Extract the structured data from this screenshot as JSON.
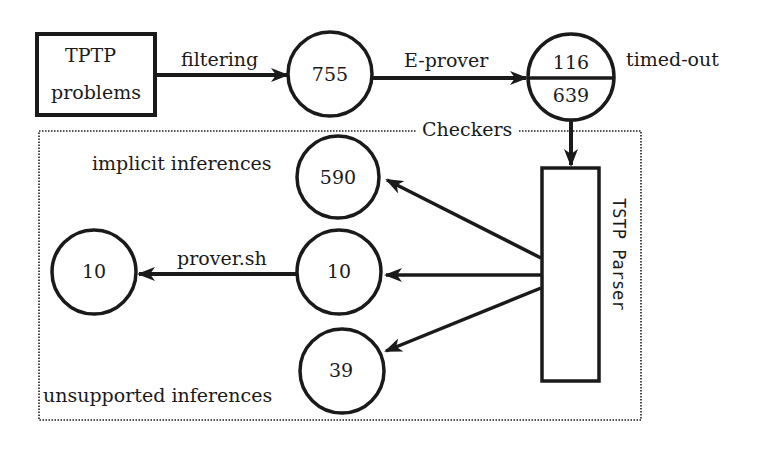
{
  "diagram": {
    "type": "flow",
    "nodes": {
      "source": {
        "line1": "TPTP",
        "line2": "problems"
      },
      "filtered": {
        "value": "755"
      },
      "split": {
        "top": "116",
        "bottom": "639",
        "note": "timed-out"
      },
      "parser": {
        "label": "TSTP Parser"
      },
      "implicit": {
        "value": "590",
        "label": "implicit inferences"
      },
      "middle": {
        "value": "10"
      },
      "prover_result": {
        "value": "10"
      },
      "unsupported": {
        "value": "39",
        "label": "unsupported inferences"
      }
    },
    "edges": {
      "filtering": "filtering",
      "eprover": "E-prover",
      "proversh": "prover.sh"
    },
    "group": {
      "label": "Checkers"
    },
    "colors": {
      "stroke": "#1a1a1a",
      "background": "#ffffff"
    }
  }
}
